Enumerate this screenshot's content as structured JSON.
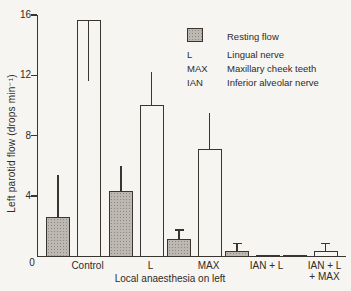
{
  "figure": {
    "background": "#f6f5f1",
    "ink_color": "#3a352f",
    "shaded_fill": "#bdb8b1"
  },
  "chart_data": {
    "type": "bar",
    "title": "",
    "xlabel": "Local anaesthesia on left",
    "ylabel": "Left parotid flow (drops min⁻¹)",
    "origin_label": "0",
    "ylim": [
      0,
      16
    ],
    "yticks": [
      0,
      4,
      8,
      12,
      16
    ],
    "grid": false,
    "legend_position": "upper-right",
    "categories": [
      "Control",
      "L",
      "MAX",
      "IAN + L",
      "IAN + L + MAX"
    ],
    "categories_lines": [
      [
        "Control"
      ],
      [
        "L"
      ],
      [
        "MAX"
      ],
      [
        "IAN + L"
      ],
      [
        "IAN + L",
        "+ MAX"
      ]
    ],
    "series": [
      {
        "name": "Resting flow",
        "style": "shaded",
        "values": [
          2.6,
          4.3,
          1.1,
          0.35,
          0.1
        ],
        "errors_plus": [
          2.8,
          1.7,
          0.6,
          0.45,
          0
        ],
        "errors_minus": [
          0,
          0,
          0,
          0,
          0
        ],
        "caps": [
          false,
          false,
          true,
          true,
          false
        ]
      },
      {
        "name": "Open bars (stimulated flow)",
        "style": "open",
        "values": [
          15.7,
          10.0,
          7.1,
          0.1,
          0.35
        ],
        "errors_plus": [
          0,
          2.2,
          2.4,
          0,
          0.45
        ],
        "errors_minus": [
          4.0,
          0,
          0,
          0,
          0
        ],
        "caps": [
          false,
          false,
          false,
          false,
          true
        ]
      }
    ],
    "legend": [
      {
        "key": "swatch",
        "label": "Resting flow"
      },
      {
        "key": "L",
        "label": "Lingual nerve"
      },
      {
        "key": "MAX",
        "label": "Maxillary cheek teeth"
      },
      {
        "key": "IAN",
        "label": "Inferior alveolar nerve"
      }
    ],
    "layout_px": {
      "plot_left": 37,
      "plot_top": 15,
      "plot_w": 308,
      "plot_h": 241,
      "group_lefts": [
        8,
        71,
        129,
        187,
        245
      ],
      "bar_offset": 30.5,
      "bar_w": 24
    }
  }
}
